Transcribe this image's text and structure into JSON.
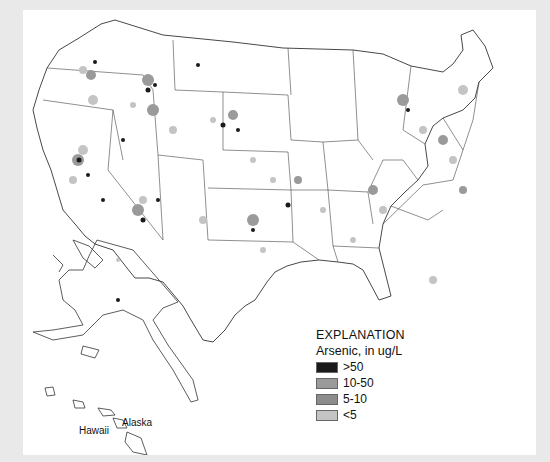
{
  "map": {
    "title": "Arsenic concentrations in ground water, United States",
    "insets": {
      "alaska_label": "Alaska",
      "hawaii_label": "Hawaii"
    }
  },
  "legend": {
    "title": "EXPLANATION",
    "subtitle": "Arsenic, in ug/L",
    "items": [
      {
        "label": ">50",
        "color": "#1a1a1a"
      },
      {
        "label": "10-50",
        "color": "#9a9a9a"
      },
      {
        "label": "5-10",
        "color": "#8c8c8c"
      },
      {
        "label": "<5",
        "color": "#c4c4c4"
      }
    ]
  },
  "colors": {
    "frame": "#e9e9e9",
    "background": "#ffffff",
    "state_lines": "#333333",
    "high": "#1a1a1a",
    "medium": "#9a9a9a",
    "low": "#c4c4c4"
  }
}
